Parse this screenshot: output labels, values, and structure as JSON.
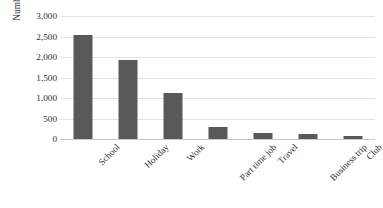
{
  "chart_data": {
    "type": "bar",
    "title": "",
    "xlabel": "",
    "ylabel": "Number of selections",
    "categories": [
      "School",
      "Holiday",
      "Work",
      "Part time job",
      "Travel",
      "Business trip",
      "Club"
    ],
    "values": [
      2530,
      1925,
      1120,
      305,
      140,
      120,
      80
    ],
    "ylim": [
      0,
      3000
    ],
    "y_ticks": [
      0,
      500,
      1000,
      1500,
      2000,
      2500,
      3000
    ],
    "y_tick_labels": [
      "0",
      "500",
      "1,000",
      "1,500",
      "2,000",
      "2,500",
      "3,000"
    ],
    "grid": true,
    "grid_axis": "y",
    "legend": false,
    "legend_position": "none",
    "bar_color": "#595959",
    "gridline_color": "#e2e2e2",
    "axis_line_color": "#c9c9c9",
    "background_color": "#ffffff",
    "x_tick_label_rotation": -45
  },
  "axis": {
    "y_title": "Number of selections"
  }
}
